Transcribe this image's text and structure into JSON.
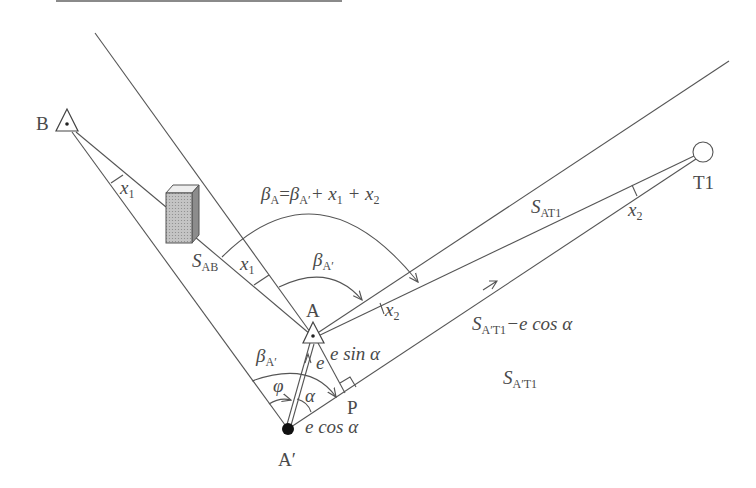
{
  "diagram": {
    "colors": {
      "line": "#555555",
      "text": "#4a4a4a",
      "building_face": "#b8b8b8",
      "building_side": "#8c8c8c",
      "top_rule": "#8a8a8a"
    },
    "nodes": {
      "B": {
        "label": "B",
        "shape": "triangle-with-dot"
      },
      "A": {
        "label": "A",
        "shape": "triangle-with-dot"
      },
      "A_prime": {
        "label": "A′",
        "shape": "filled-circle"
      },
      "T1": {
        "label": "T1",
        "shape": "open-circle"
      },
      "P": {
        "label": "P",
        "shape": "right-angle-foot"
      }
    },
    "labels": {
      "beta_A_formula": {
        "main": "β",
        "sub": "A",
        "eq": "=",
        "main2": "β",
        "sub2": "A′",
        "rest": "+ x",
        "sub3": "1",
        "rest2": " + x",
        "sub4": "2"
      },
      "beta_A_prime_upper": {
        "main": "β",
        "sub": "A′"
      },
      "beta_A_prime_lower": {
        "main": "β",
        "sub": "A′"
      },
      "x1_near_B": {
        "main": "x",
        "sub": "1"
      },
      "x1_near_A": {
        "main": "x",
        "sub": "1"
      },
      "x2_near_A": {
        "main": "x",
        "sub": "2"
      },
      "x2_near_T1": {
        "main": "x",
        "sub": "2"
      },
      "S_AB": {
        "main": "S",
        "sub": "AB"
      },
      "S_AT1": {
        "main": "S",
        "sub": "AT1"
      },
      "S_A_prime_T1_minus": {
        "main": "S",
        "sub": "A′T1",
        "rest": "−e cos α"
      },
      "S_A_prime_T1": {
        "main": "S",
        "sub": "A′T1"
      },
      "e_sin_alpha": "e sin α",
      "e_cos_alpha": "e cos α",
      "e": "e",
      "phi": "φ",
      "alpha": "α"
    }
  }
}
